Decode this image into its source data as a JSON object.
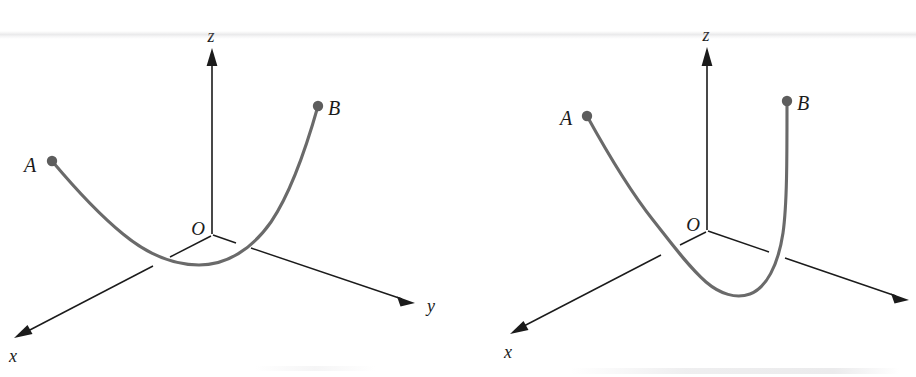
{
  "figure": {
    "background_color": "#ffffff",
    "axis_color": "#1b1b1b",
    "curve_color": "#6a6a6a",
    "point_color": "#5d5d5d",
    "panels": [
      {
        "id": "left",
        "name": "shallow-parabolic-path",
        "origin_label": "O",
        "axes": [
          {
            "name": "x",
            "label": "x"
          },
          {
            "name": "y",
            "label": "y"
          },
          {
            "name": "z",
            "label": "z"
          }
        ],
        "points": [
          {
            "name": "A",
            "label": "A"
          },
          {
            "name": "B",
            "label": "B"
          }
        ],
        "curve": {
          "type": "space-curve",
          "from": "A",
          "to": "B",
          "shape": "shallow upward-opening parabola lying near the xy-plane",
          "crosses_xy_plane": true
        }
      },
      {
        "id": "right",
        "name": "deep-u-shaped-path",
        "origin_label": "O",
        "axes": [
          {
            "name": "x",
            "label": "x"
          },
          {
            "name": "y",
            "label": ""
          },
          {
            "name": "z",
            "label": "z"
          }
        ],
        "points": [
          {
            "name": "A",
            "label": "A"
          },
          {
            "name": "B",
            "label": "B"
          }
        ],
        "curve": {
          "type": "space-curve",
          "from": "A",
          "to": "B",
          "shape": "deep narrow U dipping below the xy-plane with a near-vertical rise to B",
          "crosses_xy_plane": true
        }
      }
    ]
  }
}
